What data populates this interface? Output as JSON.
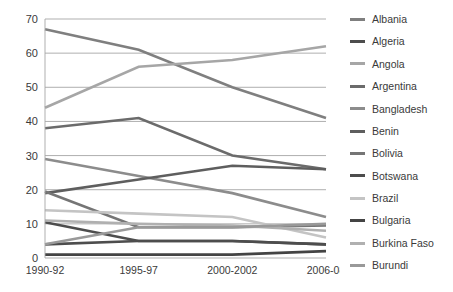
{
  "chart_data": {
    "type": "line",
    "title": "",
    "subtitle": "",
    "xlabel": "",
    "ylabel": "",
    "categories": [
      "1990-92",
      "1995-97",
      "2000-2002",
      "2006-08"
    ],
    "ylim": [
      0,
      70
    ],
    "ytick_step": 10,
    "yticks": [
      "0",
      "10",
      "20",
      "30",
      "40",
      "50",
      "60",
      "70"
    ],
    "grid": true,
    "legend_position": "right",
    "series": [
      {
        "name": "Albania",
        "values": [
          67,
          61,
          50,
          41
        ],
        "color": "#7f7f7f",
        "width": 2.6
      },
      {
        "name": "Algeria",
        "values": [
          4,
          5,
          5,
          4
        ],
        "color": "#4d4d4d",
        "width": 2.6
      },
      {
        "name": "Angola",
        "values": [
          44,
          56,
          58,
          62
        ],
        "color": "#a6a6a6",
        "width": 2.6
      },
      {
        "name": "Argentina",
        "values": [
          38,
          41,
          30,
          26
        ],
        "color": "#6b6b6b",
        "width": 2.6
      },
      {
        "name": "Bangladesh",
        "values": [
          29,
          24,
          19,
          12
        ],
        "color": "#8c8c8c",
        "width": 2.6
      },
      {
        "name": "Benin",
        "values": [
          19,
          23,
          27,
          26
        ],
        "color": "#5e5e5e",
        "width": 2.6
      },
      {
        "name": "Bolivia",
        "values": [
          19.5,
          9,
          9,
          9.5
        ],
        "color": "#757575",
        "width": 2.6
      },
      {
        "name": "Botswana",
        "values": [
          10.5,
          5,
          5,
          4
        ],
        "color": "#4d4d4d",
        "width": 2.6
      },
      {
        "name": "Brazil",
        "values": [
          14,
          13,
          12,
          6
        ],
        "color": "#c4c4c4",
        "width": 2.6
      },
      {
        "name": "Bulgaria",
        "values": [
          1,
          1,
          1,
          2
        ],
        "color": "#444444",
        "width": 2.6
      },
      {
        "name": "Burkina Faso",
        "values": [
          11,
          10,
          9.5,
          8
        ],
        "color": "#b0b0b0",
        "width": 2.6
      },
      {
        "name": "Burundi",
        "values": [
          4,
          9,
          9,
          10
        ],
        "color": "#999999",
        "width": 2.6
      }
    ]
  },
  "legend": {
    "items": [
      {
        "label": "Albania"
      },
      {
        "label": "Algeria"
      },
      {
        "label": "Angola"
      },
      {
        "label": "Argentina"
      },
      {
        "label": "Bangladesh"
      },
      {
        "label": "Benin"
      },
      {
        "label": "Bolivia"
      },
      {
        "label": "Botswana"
      },
      {
        "label": "Brazil"
      },
      {
        "label": "Bulgaria"
      },
      {
        "label": "Burkina Faso"
      },
      {
        "label": "Burundi"
      }
    ]
  },
  "axes": {
    "grid_color": "#a6a6a6",
    "label_color": "#3a3a3a"
  }
}
